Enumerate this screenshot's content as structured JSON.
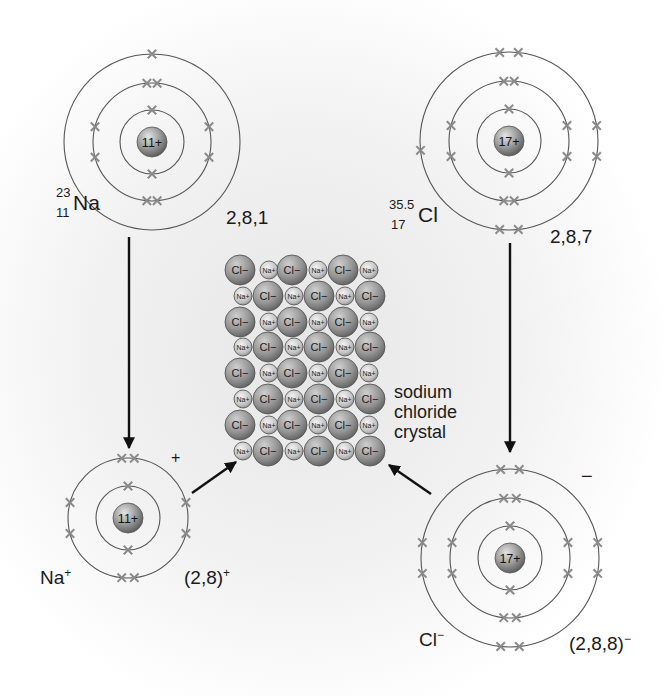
{
  "colors": {
    "ring": "#555555",
    "electron": "#8a8a8a",
    "nucleus_light": "#d8d8d8",
    "nucleus_dark": "#6e6e6e",
    "arrow": "#111111",
    "text": "#1a1a1a",
    "backdrop": "#e9e9e9"
  },
  "atoms": [
    {
      "id": "sodium-atom",
      "cx": 152,
      "cy": 142,
      "nucleus_label": "11+",
      "rings": [
        32,
        59,
        88
      ],
      "electrons": [
        {
          "ring": 0,
          "angles": [
            90,
            270
          ]
        },
        {
          "ring": 1,
          "angles": [
            275,
            265,
            345,
            15,
            165,
            195,
            85,
            95
          ]
        },
        {
          "ring": 2,
          "angles": [
            270
          ]
        }
      ],
      "symbol": "Na",
      "mass_number": "23",
      "atomic_number": "11",
      "configuration": "2,8,1"
    },
    {
      "id": "chlorine-atom",
      "cx": 509,
      "cy": 141,
      "nucleus_label": "17+",
      "rings": [
        32,
        60,
        89
      ],
      "electrons": [
        {
          "ring": 0,
          "angles": [
            90,
            270
          ]
        },
        {
          "ring": 1,
          "angles": [
            275,
            265,
            345,
            15,
            165,
            195,
            85,
            95
          ]
        },
        {
          "ring": 2,
          "angles": [
            276,
            264,
            350,
            10,
            174,
            84,
            96
          ]
        }
      ],
      "symbol": "Cl",
      "mass_number": "35.5",
      "atomic_number": "17",
      "configuration": "2,8,7"
    },
    {
      "id": "sodium-ion",
      "cx": 128,
      "cy": 518,
      "nucleus_label": "11+",
      "rings": [
        32,
        60
      ],
      "electrons": [
        {
          "ring": 0,
          "angles": [
            90,
            270
          ]
        },
        {
          "ring": 1,
          "angles": [
            276,
            264,
            345,
            15,
            165,
            195,
            84,
            96
          ]
        }
      ],
      "symbol": "Na",
      "charge": "+",
      "configuration": "(2,8)",
      "config_charge": "+",
      "charge_mark": "+"
    },
    {
      "id": "chloride-ion",
      "cx": 510,
      "cy": 558,
      "nucleus_label": "17+",
      "rings": [
        32,
        60,
        89
      ],
      "electrons": [
        {
          "ring": 0,
          "angles": [
            90,
            270
          ]
        },
        {
          "ring": 1,
          "angles": [
            276,
            264,
            345,
            15,
            165,
            195,
            84,
            96
          ]
        },
        {
          "ring": 2,
          "angles": [
            276,
            264,
            350,
            10,
            170,
            190,
            84,
            96
          ]
        }
      ],
      "symbol": "Cl",
      "charge": "−",
      "configuration": "(2,8,8)",
      "config_charge": "−",
      "charge_mark": "−"
    }
  ],
  "crystal": {
    "label_lines": [
      "sodium",
      "chloride",
      "crystal"
    ],
    "rows_y": [
      270,
      296,
      322,
      347,
      373,
      399,
      425,
      451
    ],
    "even_row_x": [
      240,
      269,
      292,
      318,
      343,
      369
    ],
    "odd_row_x": [
      243,
      268,
      294,
      319,
      345,
      370
    ],
    "cl_radius": 15,
    "na_radius": 9,
    "cl_label": "Cl−",
    "na_label": "Na+"
  },
  "arrows": [
    {
      "id": "na-to-ion-arrow",
      "x1": 129,
      "y1": 237,
      "x2": 129,
      "y2": 448
    },
    {
      "id": "cl-to-ion-arrow",
      "x1": 510,
      "y1": 243,
      "x2": 510,
      "y2": 452
    },
    {
      "id": "na-ion-to-crystal-arrow",
      "x1": 192,
      "y1": 493,
      "x2": 236,
      "y2": 462
    },
    {
      "id": "cl-ion-to-crystal-arrow",
      "x1": 431,
      "y1": 494,
      "x2": 389,
      "y2": 465
    }
  ],
  "labels": {
    "na_atom": {
      "mass": "23",
      "number": "11",
      "symbol": "Na",
      "config": "2,8,1"
    },
    "cl_atom": {
      "mass": "35.5",
      "number": "17",
      "symbol": "Cl",
      "config": "2,8,7"
    },
    "na_ion": {
      "symbol": "Na",
      "charge": "+",
      "config": "(2,8)",
      "config_charge": "+",
      "mark": "+"
    },
    "cl_ion": {
      "symbol": "Cl",
      "charge": "−",
      "config": "(2,8,8)",
      "config_charge": "−",
      "mark": "−"
    },
    "crystal": {
      "line1": "sodium",
      "line2": "chloride",
      "line3": "crystal"
    }
  }
}
